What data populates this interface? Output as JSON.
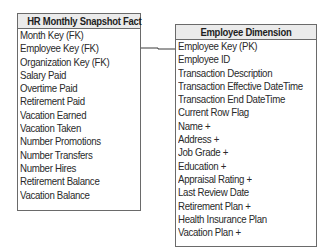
{
  "fact_table": {
    "title": "HR Monthly Snapshot Fact",
    "columns": [
      "Month Key (FK)",
      "Employee Key (FK)",
      "Organization Key (FK)",
      "Salary Paid",
      "Overtime Paid",
      "Retirement Paid",
      "Vacation Earned",
      "Vacation Taken",
      "Number Promotions",
      "Number Transfers",
      "Number Hires",
      "Retirement Balance",
      "Vacation Balance"
    ]
  },
  "dimension_table": {
    "title": "Employee Dimension",
    "columns": [
      "Employee Key (PK)",
      "Employee ID",
      "Transaction Description",
      "Transaction Effective DateTime",
      "Transaction End DateTime",
      "Current Row Flag",
      "Name +",
      "Address +",
      "Job Grade +",
      "Education +",
      "Appraisal Rating +",
      "Last Review Date",
      "Retirement Plan +",
      "Health Insurance Plan",
      "Vacation Plan +"
    ]
  },
  "relationship": {
    "from": "HR Monthly Snapshot Fact.Employee Key (FK)",
    "to": "Employee Dimension.Employee Key (PK)"
  }
}
